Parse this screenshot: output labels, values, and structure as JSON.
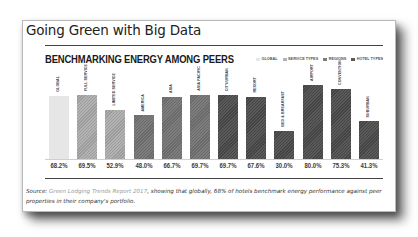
{
  "page": {
    "title": "Going Green with Big Data"
  },
  "chart": {
    "title": "BENCHMARKING ENERGY AMONG PEERS",
    "legend": [
      {
        "label": "GLOBAL",
        "color": "#e6e6e6"
      },
      {
        "label": "SERVICE TYPES",
        "color": "#b3b3b3"
      },
      {
        "label": "REGIONS",
        "color": "#7d7d7d"
      },
      {
        "label": "HOTEL TYPES",
        "color": "#5a5a5a"
      }
    ]
  },
  "caption": {
    "prefix": "Source: ",
    "link": "Green Lodging Trends Report 2017",
    "suffix": ", showing that globally, 68% of hotels benchmark energy performance against peer properties in their company's portfolio."
  },
  "chart_data": {
    "type": "bar",
    "title": "BENCHMARKING ENERGY AMONG PEERS",
    "xlabel": "",
    "ylabel": "",
    "ylim": [
      0,
      100
    ],
    "grid": false,
    "legend_position": "top-right",
    "categories": [
      "GLOBAL",
      "FULL SERVICE",
      "LIMITED SERVICE",
      "AMERICA",
      "ASIA",
      "ASIA PACIFIC",
      "CITY/URBAN",
      "RESORT",
      "BED & BREAKFAST",
      "AIRPORT",
      "CONVENTION",
      "SUBURBAN"
    ],
    "values": [
      68.2,
      69.5,
      52.9,
      48.0,
      66.7,
      69.7,
      69.7,
      67.6,
      30.0,
      80.0,
      75.3,
      41.3
    ],
    "value_labels": [
      "68.2%",
      "69.5%",
      "52.9%",
      "48.0%",
      "66.7%",
      "69.7%",
      "69.7%",
      "67.6%",
      "30.0%",
      "80.0%",
      "75.3%",
      "41.3%"
    ],
    "groups": [
      "GLOBAL",
      "SERVICE TYPES",
      "SERVICE TYPES",
      "REGIONS",
      "REGIONS",
      "REGIONS",
      "HOTEL TYPES",
      "HOTEL TYPES",
      "HOTEL TYPES",
      "HOTEL TYPES",
      "HOTEL TYPES",
      "HOTEL TYPES"
    ],
    "series": [
      {
        "name": "GLOBAL",
        "values": [
          68.2,
          null,
          null,
          null,
          null,
          null,
          null,
          null,
          null,
          null,
          null,
          null
        ]
      },
      {
        "name": "SERVICE TYPES",
        "values": [
          null,
          69.5,
          52.9,
          null,
          null,
          null,
          null,
          null,
          null,
          null,
          null,
          null
        ]
      },
      {
        "name": "REGIONS",
        "values": [
          null,
          null,
          null,
          48.0,
          66.7,
          69.7,
          null,
          null,
          null,
          null,
          null,
          null
        ]
      },
      {
        "name": "HOTEL TYPES",
        "values": [
          null,
          null,
          null,
          null,
          null,
          null,
          69.7,
          67.6,
          30.0,
          80.0,
          75.3,
          41.3
        ]
      }
    ]
  }
}
